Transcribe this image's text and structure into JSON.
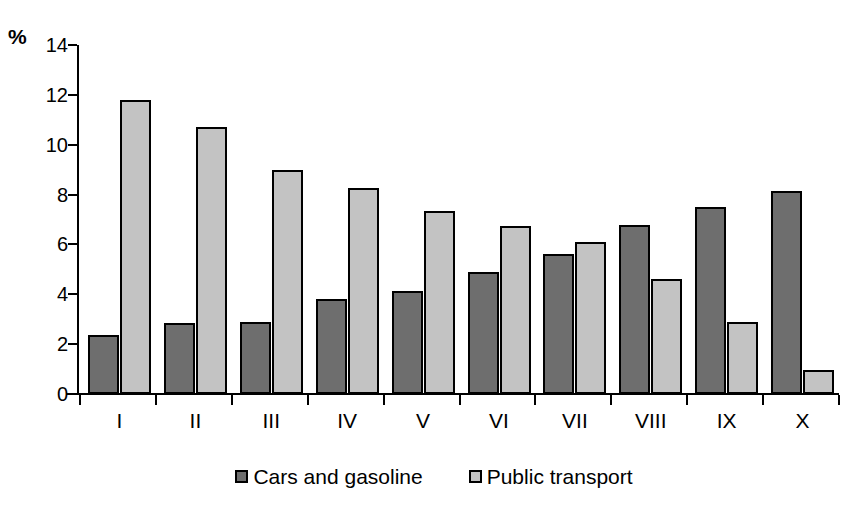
{
  "chart_data": {
    "type": "bar",
    "title": "",
    "xlabel": "",
    "ylabel": "%",
    "ylim": [
      0,
      14
    ],
    "yticks": [
      0,
      2,
      4,
      6,
      8,
      10,
      12,
      14
    ],
    "grid": false,
    "legend_position": "bottom",
    "categories": [
      "I",
      "II",
      "III",
      "IV",
      "V",
      "VI",
      "VII",
      "VIII",
      "IX",
      "X"
    ],
    "series": [
      {
        "name": "Cars and gasoline",
        "color": "#6e6e6e",
        "values": [
          2.35,
          2.85,
          2.9,
          3.8,
          4.15,
          4.9,
          5.6,
          6.8,
          7.5,
          8.15
        ]
      },
      {
        "name": "Public transport",
        "color": "#c3c3c3",
        "values": [
          11.8,
          10.7,
          9.0,
          8.25,
          7.35,
          6.75,
          6.1,
          4.6,
          2.9,
          0.95
        ]
      }
    ]
  },
  "axis": {
    "unit_label": "%"
  },
  "legend": {
    "items": [
      {
        "label": "Cars and gasoline"
      },
      {
        "label": "Public transport"
      }
    ]
  }
}
